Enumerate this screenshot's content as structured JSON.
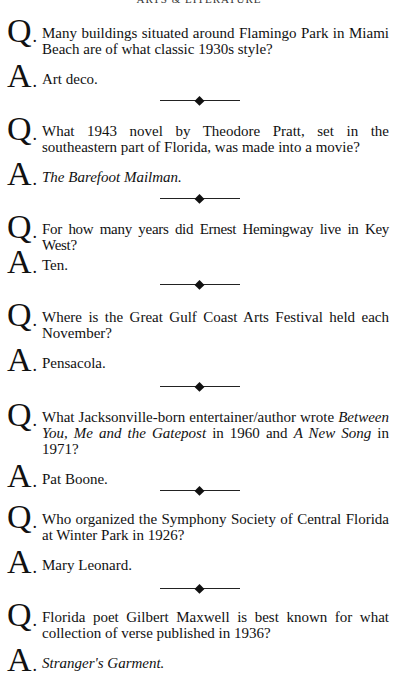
{
  "page": {
    "running_head": "ARTS & LITERATURE"
  },
  "qa": [
    {
      "q_label": "Q",
      "question": "Many buildings situated around Flamingo Park in Miami Beach are of what classic 1930s style?",
      "a_label": "A",
      "answer": "Art deco."
    },
    {
      "q_label": "Q",
      "question": "What 1943 novel by Theodore Pratt, set in the southeastern part of Florida, was made into a movie?",
      "a_label": "A",
      "answer": "The Barefoot Mailman.",
      "answer_italic": true
    },
    {
      "q_label": "Q",
      "question": "For how many years did Ernest Hemingway live in Key West?",
      "a_label": "A",
      "answer": "Ten."
    },
    {
      "q_label": "Q",
      "question": "Where is the Great Gulf Coast Arts Festival held each November?",
      "a_label": "A",
      "answer": "Pensacola."
    },
    {
      "q_label": "Q",
      "question_parts": {
        "p1": "What Jacksonville-born entertainer/author wrote ",
        "i1": "Between You, Me and the Gatepost",
        "p2": " in 1960 and ",
        "i2": "A New Song",
        "p3": " in 1971?"
      },
      "a_label": "A",
      "answer": "Pat Boone."
    },
    {
      "q_label": "Q",
      "question": "Who organized the Symphony Society of Central Florida at Winter Park in 1926?",
      "a_label": "A",
      "answer": "Mary Leonard."
    },
    {
      "q_label": "Q",
      "question": "Florida poet Gilbert Maxwell is best known for what collection of verse published in 1936?",
      "a_label": "A",
      "answer": "Stranger's Garment.",
      "answer_italic": true
    }
  ],
  "divider": {
    "icon": "diamond-ornament-icon"
  }
}
